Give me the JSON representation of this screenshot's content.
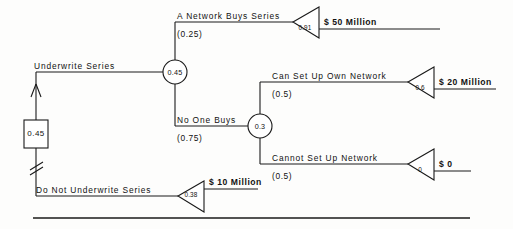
{
  "diagram": {
    "type": "decision-tree",
    "title": "",
    "decision_node": {
      "value": "0.45",
      "shape": "square",
      "chosen_branch": "Underwrite Series",
      "pruned_branch": "Do Not Underwrite Series"
    },
    "branches": {
      "underwrite": {
        "label": "Underwrite Series",
        "chance_node": "0.45"
      },
      "do_not_underwrite": {
        "label": "Do Not Underwrite Series",
        "terminal_value": "0.38",
        "payoff": "$ 10 Million"
      },
      "network_buys": {
        "label": "A Network Buys Series",
        "probability": "(0.25)",
        "terminal_value": "0.91",
        "payoff": "$ 50 Million"
      },
      "no_one_buys": {
        "label": "No One Buys",
        "probability": "(0.75)",
        "chance_node": "0.3"
      },
      "can_set_up": {
        "label": "Can Set Up Own Network",
        "probability": "(0.5)",
        "terminal_value": "0.6",
        "payoff": "$ 20 Million"
      },
      "cannot_set_up": {
        "label": "Cannot Set Up Network",
        "probability": "(0.5)",
        "terminal_value": "0",
        "payoff": "$ 0"
      }
    },
    "colors": {
      "line": "#1a1a1a",
      "text": "#111111",
      "background": "#fdfdfc"
    }
  }
}
